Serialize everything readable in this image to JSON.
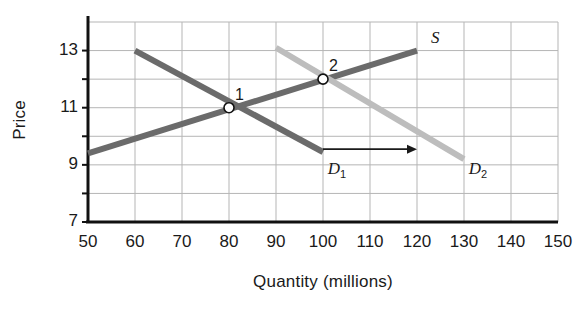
{
  "chart_data": {
    "type": "line",
    "title": "",
    "xlabel": "Quantity (millions)",
    "ylabel": "Price",
    "xlim": [
      50,
      150
    ],
    "ylim": [
      7,
      14
    ],
    "xticks": [
      "50",
      "60",
      "70",
      "80",
      "90",
      "100",
      "110",
      "120",
      "130",
      "140",
      "150"
    ],
    "yticks": [
      "13",
      "11",
      "9",
      "7"
    ],
    "ytick_values": [
      13,
      11,
      9,
      7
    ],
    "grid": true,
    "grid_x_step": 10,
    "grid_y_step": 1,
    "legend_position": "inline-labels",
    "series": [
      {
        "name": "S",
        "label": "S",
        "role": "supply",
        "color": "#6b6b6b",
        "x": [
          50,
          120
        ],
        "y": [
          9.4,
          13.0
        ],
        "label_x": 123,
        "label_y": 13.45
      },
      {
        "name": "D1",
        "label": "D",
        "label_sub": "1",
        "role": "demand-original",
        "color": "#6b6b6b",
        "x": [
          60,
          100
        ],
        "y": [
          13.0,
          9.45
        ],
        "label_x": 101,
        "label_y": 8.85
      },
      {
        "name": "D2",
        "label": "D",
        "label_sub": "2",
        "role": "demand-shifted",
        "color": "#bdbdbd",
        "x": [
          90,
          130
        ],
        "y": [
          13.1,
          9.2
        ],
        "label_x": 131,
        "label_y": 8.85
      }
    ],
    "points": [
      {
        "label": "1",
        "x": 80,
        "y": 11.0,
        "label_dx": 6,
        "label_dy": -10
      },
      {
        "label": "2",
        "x": 100,
        "y": 12.0,
        "label_dx": 6,
        "label_dy": -10
      }
    ],
    "annotations": [
      {
        "name": "shift-arrow",
        "type": "arrow",
        "x_start": 100,
        "x_end": 120,
        "y": 9.55,
        "color": "#1a1a1a"
      }
    ]
  },
  "colors": {
    "axis": "#111111",
    "grid": "#b5b5b5",
    "supply": "#6b6b6b",
    "demand_1": "#6b6b6b",
    "demand_2": "#bdbdbd",
    "text": "#1a1a1a",
    "background": "#ffffff"
  }
}
